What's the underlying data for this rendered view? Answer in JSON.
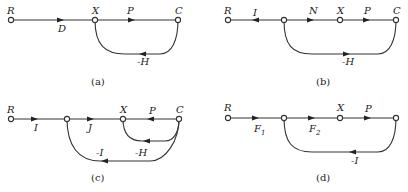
{
  "diagrams": [
    {
      "caption": "(a)",
      "nodes": [
        "R",
        "X",
        "C"
      ],
      "edges": [
        {
          "from": "R",
          "to": "X",
          "gain": "D"
        },
        {
          "from": "X",
          "to": "C",
          "gain": "P"
        },
        {
          "from": "C",
          "to": "X",
          "gain": "-H",
          "type": "feedback"
        }
      ],
      "labels": {
        "R": "R",
        "X": "X",
        "C": "C",
        "D": "D",
        "P": "P",
        "H": "-H"
      }
    },
    {
      "caption": "(b)",
      "nodes": [
        "R",
        "n1",
        "X",
        "C"
      ],
      "edges": [
        {
          "from": "n1",
          "to": "R",
          "gain": "I"
        },
        {
          "from": "n1",
          "to": "X",
          "gain": "N"
        },
        {
          "from": "X",
          "to": "C",
          "gain": "P"
        },
        {
          "from": "n1",
          "to": "C",
          "gain": "-H",
          "type": "loop"
        }
      ],
      "labels": {
        "R": "R",
        "I": "I",
        "N": "N",
        "X": "X",
        "P": "P",
        "C": "C",
        "H": "-H"
      }
    },
    {
      "caption": "(c)",
      "nodes": [
        "R",
        "n1",
        "X",
        "C"
      ],
      "edges": [
        {
          "from": "R",
          "to": "n1",
          "gain": "I"
        },
        {
          "from": "n1",
          "to": "X",
          "gain": "J"
        },
        {
          "from": "C",
          "to": "X",
          "gain": "P"
        },
        {
          "from": "C",
          "to": "X",
          "gain": "-H",
          "type": "feedback"
        },
        {
          "from": "C",
          "to": "n1",
          "gain": "-I",
          "type": "feedback"
        }
      ],
      "labels": {
        "R": "R",
        "I": "I",
        "J": "J",
        "X": "X",
        "P": "P",
        "C": "C",
        "H": "-H",
        "negI": "-I"
      }
    },
    {
      "caption": "(d)",
      "nodes": [
        "R",
        "n1",
        "X",
        "n2"
      ],
      "edges": [
        {
          "from": "R",
          "to": "n1",
          "gain": "F1"
        },
        {
          "from": "n1",
          "to": "X",
          "gain": "F2"
        },
        {
          "from": "X",
          "to": "n2",
          "gain": "P"
        },
        {
          "from": "n2",
          "to": "n1",
          "gain": "-I",
          "type": "feedback"
        }
      ],
      "labels": {
        "R": "R",
        "F": "F",
        "F1sub": "1",
        "F2sub": "2",
        "X": "X",
        "P": "P",
        "negI": "-I"
      }
    }
  ]
}
